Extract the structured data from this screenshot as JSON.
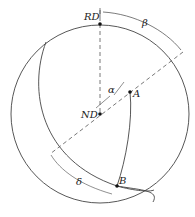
{
  "labels": {
    "rd": "RD",
    "nd": "ND",
    "a": "A",
    "b": "B",
    "alpha": "α",
    "beta": "β",
    "delta": "δ"
  },
  "colors": {
    "stroke": "#333333",
    "dash": "#555555"
  }
}
